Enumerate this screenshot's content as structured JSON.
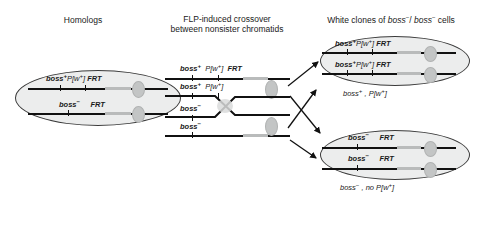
{
  "figure": {
    "headers": {
      "left": "Homologs",
      "middle_line1": "FLP-induced crossover",
      "middle_line2": "between nonsister chromatids",
      "right": "White clones of boss⁻/ boss⁻ cells"
    },
    "colors": {
      "chromatid": "#111111",
      "frt_bar": "#b9bbbb",
      "cell_fill": "#eceded",
      "cell_stroke": "#3a3a3a",
      "centromere": "#c3c5c5",
      "text": "#1a1a1a",
      "background": "#ffffff"
    },
    "left_cell": {
      "name": "homologs-cell",
      "rows": [
        {
          "gene": "boss",
          "gene_sup": "+",
          "transgene": "P[w⁺]",
          "frt": "FRT",
          "has_transgene": true
        },
        {
          "gene": "boss",
          "gene_sup": "−",
          "transgene": "",
          "frt": "FRT",
          "has_transgene": false
        }
      ]
    },
    "middle": {
      "name": "crossover-chromatids",
      "rows": [
        {
          "gene": "boss",
          "gene_sup": "+",
          "transgene": "P[w⁺]",
          "frt": "FRT",
          "has_transgene": true,
          "has_frt_label": true
        },
        {
          "gene": "boss",
          "gene_sup": "+",
          "transgene": "P[w⁺]",
          "frt": "",
          "has_transgene": true,
          "has_frt_label": false
        },
        {
          "gene": "boss",
          "gene_sup": "−",
          "transgene": "",
          "frt": "",
          "has_transgene": false,
          "has_frt_label": false
        },
        {
          "gene": "boss",
          "gene_sup": "−",
          "transgene": "",
          "frt": "",
          "has_transgene": false,
          "has_frt_label": false
        }
      ]
    },
    "top_right_cell": {
      "name": "white-clone-cell-boss-plus",
      "rows": [
        {
          "gene": "boss",
          "gene_sup": "+",
          "transgene": "P[w⁺]",
          "frt": "FRT",
          "has_transgene": true
        },
        {
          "gene": "boss",
          "gene_sup": "+",
          "transgene": "P[w⁺]",
          "frt": "FRT",
          "has_transgene": true
        }
      ],
      "caption_gene": "boss",
      "caption_sup": "+",
      "caption_rest": ", P[w⁺]"
    },
    "bottom_right_cell": {
      "name": "white-clone-cell-boss-minus",
      "rows": [
        {
          "gene": "boss",
          "gene_sup": "−",
          "transgene": "",
          "frt": "FRT",
          "has_transgene": false
        },
        {
          "gene": "boss",
          "gene_sup": "−",
          "transgene": "",
          "frt": "FRT",
          "has_transgene": false
        }
      ],
      "caption_gene": "boss",
      "caption_sup": "−",
      "caption_rest": ", no P[w⁺]"
    },
    "arrows": {
      "count": 4,
      "description": "two arrows to upper cell, two arrows to lower cell"
    }
  }
}
